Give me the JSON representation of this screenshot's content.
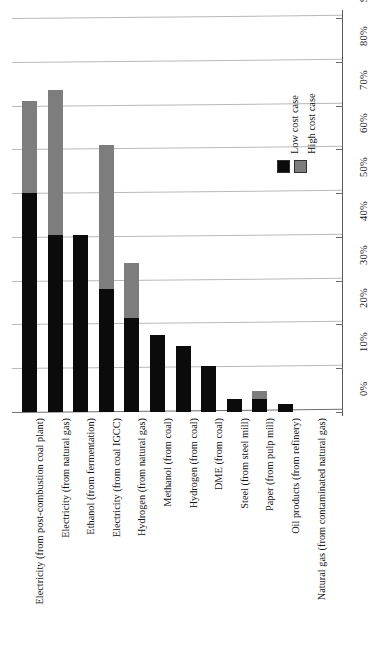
{
  "chart_data": {
    "type": "bar",
    "title": "",
    "subtitle": "",
    "xlabel": "",
    "ylabel": "",
    "stacked": true,
    "orientation": "vertical",
    "grid": true,
    "legend_position": "inside-right",
    "ylim": [
      0,
      90
    ],
    "ytick_labels": [
      "0%",
      "10%",
      "20%",
      "30%",
      "40%",
      "50%",
      "60%",
      "70%",
      "80%",
      "90%"
    ],
    "ytick_values": [
      0,
      10,
      20,
      30,
      40,
      50,
      60,
      70,
      80,
      90
    ],
    "categories": [
      "Electricity (from post-combustion coal plant)",
      "Electricity (from natural gas)",
      "Ethanol (from fermentation)",
      "Electricity (from coal IGCC)",
      "Hydrogen (from natural gas)",
      "Methanol (from coal)",
      "Hydrogen (from coal)",
      "DME (from coal)",
      "Steel (from steel mill)",
      "Paper (from pulp mill)",
      "Oil products (from refinery)",
      "Natural gas (from contaminated natural gas)"
    ],
    "series": [
      {
        "name": "Low cost case",
        "color": "#0b0b0b",
        "values": [
          50.0,
          40.5,
          40.5,
          28.0,
          21.5,
          17.5,
          15.0,
          10.5,
          3.0,
          3.0,
          1.8,
          0.0
        ]
      },
      {
        "name": "High cost case",
        "color": "#7d7d7d",
        "values": [
          71.0,
          73.5,
          40.5,
          61.0,
          34.0,
          17.5,
          15.0,
          10.5,
          3.0,
          4.7,
          1.8,
          0.0
        ]
      }
    ],
    "legend": [
      {
        "label": "Low cost case",
        "color": "#0b0b0b"
      },
      {
        "label": "High cost case",
        "color": "#7d7d7d"
      }
    ]
  },
  "colors": {
    "low_cost": "#0b0b0b",
    "high_cost": "#7d7d7d",
    "gridline": "#b9b9b9",
    "axis": "#5a5a5a",
    "background": "#ffffff"
  }
}
